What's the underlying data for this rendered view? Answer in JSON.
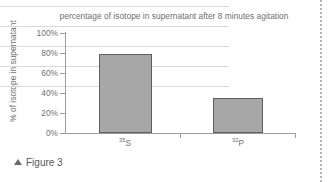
{
  "figure": {
    "caption_marker": "▲",
    "caption_text": "Figure 3"
  },
  "chart_data": {
    "type": "bar",
    "title": "percentage of isotope in supernatant after 8 minutes agitation",
    "xlabel": "",
    "ylabel": "% of isotope in supernatant",
    "categories": [
      "35S",
      "32P"
    ],
    "category_labels": [
      {
        "superscript": "35",
        "symbol": "S"
      },
      {
        "superscript": "32",
        "symbol": "P"
      }
    ],
    "values": [
      79,
      35
    ],
    "ylim": [
      0,
      100
    ],
    "ytick_values": [
      0,
      20,
      40,
      60,
      80,
      100
    ],
    "ytick_labels": [
      "0%",
      "20%",
      "40%",
      "60%",
      "80%",
      "100%"
    ],
    "grid": true,
    "legend": null,
    "bar_fill_color": "#a7a7a7",
    "bar_border_color": "#5f5f5f",
    "axis_color": "#9c9c9c",
    "grid_color": "#d9d9d9",
    "text_color": "#6f6f6f"
  }
}
